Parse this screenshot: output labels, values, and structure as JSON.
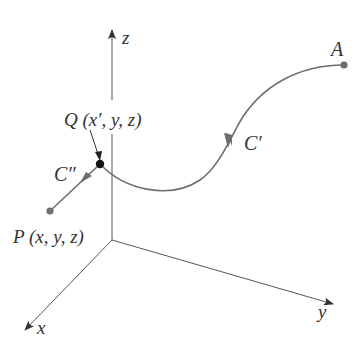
{
  "diagram": {
    "axes": {
      "x_label": "x",
      "y_label": "y",
      "z_label": "z"
    },
    "points": {
      "A": "A",
      "Q": "Q (x′, y, z)",
      "P": "P (x, y, z)"
    },
    "curves": {
      "c_prime": "C′",
      "c_double_prime": "C″"
    },
    "colors": {
      "axis": "#555555",
      "curve": "#6e6e6e",
      "point": "#6e6e6e",
      "point_q": "#111111",
      "text": "#333333"
    }
  }
}
